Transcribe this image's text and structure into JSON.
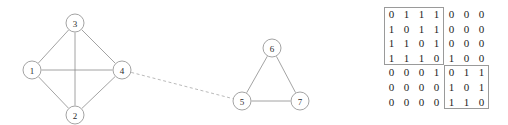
{
  "graph": {
    "nodes": [
      {
        "id": "1",
        "label": "1",
        "cx": 32,
        "cy": 70,
        "r": 9
      },
      {
        "id": "2",
        "label": "2",
        "cx": 75,
        "cy": 115,
        "r": 9
      },
      {
        "id": "3",
        "label": "3",
        "cx": 75,
        "cy": 23,
        "r": 9
      },
      {
        "id": "4",
        "label": "4",
        "cx": 122,
        "cy": 70,
        "r": 9
      },
      {
        "id": "5",
        "label": "5",
        "cx": 242,
        "cy": 101,
        "r": 9
      },
      {
        "id": "6",
        "label": "6",
        "cx": 272,
        "cy": 48,
        "r": 9
      },
      {
        "id": "7",
        "label": "7",
        "cx": 300,
        "cy": 101,
        "r": 9
      }
    ],
    "edges": [
      {
        "from": "1",
        "to": "3",
        "style": "solid"
      },
      {
        "from": "1",
        "to": "2",
        "style": "solid"
      },
      {
        "from": "1",
        "to": "4",
        "style": "solid"
      },
      {
        "from": "2",
        "to": "3",
        "style": "solid"
      },
      {
        "from": "2",
        "to": "4",
        "style": "solid"
      },
      {
        "from": "3",
        "to": "4",
        "style": "solid"
      },
      {
        "from": "4",
        "to": "5",
        "style": "dashed"
      },
      {
        "from": "5",
        "to": "6",
        "style": "solid"
      },
      {
        "from": "5",
        "to": "7",
        "style": "solid"
      },
      {
        "from": "6",
        "to": "7",
        "style": "solid"
      }
    ],
    "colors": {
      "node_stroke": "#8c8c8c",
      "node_fill": "#ffffff",
      "edge_stroke": "#8c8c8c",
      "bridge_stroke": "#a8a8a8",
      "label_color": "#2b2b2b"
    }
  },
  "matrix": {
    "rows": [
      [
        "0",
        "1",
        "1",
        "1",
        "0",
        "0",
        "0"
      ],
      [
        "1",
        "0",
        "1",
        "1",
        "0",
        "0",
        "0"
      ],
      [
        "1",
        "1",
        "0",
        "1",
        "0",
        "0",
        "0"
      ],
      [
        "1",
        "1",
        "1",
        "0",
        "1",
        "0",
        "0"
      ],
      [
        "0",
        "0",
        "0",
        "1",
        "0",
        "1",
        "1"
      ],
      [
        "0",
        "0",
        "0",
        "0",
        "1",
        "0",
        "1"
      ],
      [
        "0",
        "0",
        "0",
        "0",
        "1",
        "1",
        "0"
      ]
    ],
    "blocks": [
      {
        "name": "upper-left-block",
        "row_start": 0,
        "row_end": 3,
        "col_start": 0,
        "col_end": 3
      },
      {
        "name": "lower-right-block",
        "row_start": 4,
        "row_end": 6,
        "col_start": 4,
        "col_end": 6
      }
    ],
    "colors": {
      "box_stroke": "#9a9a9a",
      "digit_color": "#1c1c1c"
    }
  }
}
